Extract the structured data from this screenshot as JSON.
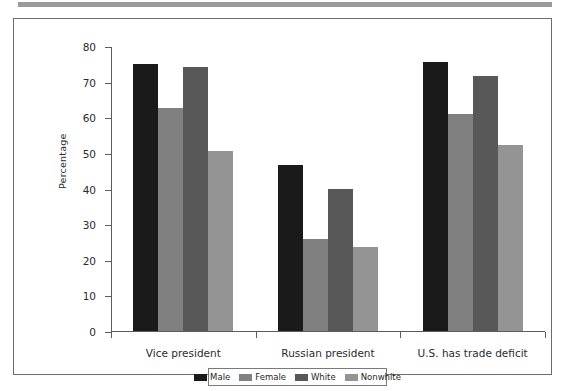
{
  "figure": {
    "top_rule_color": "#9a9a9a",
    "frame_border_color": "#6d6d6d"
  },
  "chart_data": {
    "type": "bar",
    "title": "",
    "subtitle": "",
    "xlabel": "",
    "ylabel": "Percentage",
    "ylim": [
      0,
      80
    ],
    "yticks": [
      0,
      10,
      20,
      30,
      40,
      50,
      60,
      70,
      80
    ],
    "ytick_labels": [
      "0",
      "10",
      "20",
      "30",
      "40",
      "50",
      "60",
      "70",
      "80"
    ],
    "grid": false,
    "legend_position": "bottom-center",
    "categories": [
      "Vice president",
      "Russian president",
      "U.S. has trade deficit"
    ],
    "series": [
      {
        "name": "Male",
        "color": "#1a1a1a",
        "values": [
          75.0,
          46.7,
          75.5
        ]
      },
      {
        "name": "Female",
        "color": "#808080",
        "values": [
          62.5,
          25.8,
          61.0
        ]
      },
      {
        "name": "White",
        "color": "#585858",
        "values": [
          74.0,
          39.8,
          71.5
        ]
      },
      {
        "name": "Nonwhite",
        "color": "#949494",
        "values": [
          50.5,
          23.5,
          52.3
        ]
      }
    ]
  },
  "legend": {
    "items": [
      {
        "label": "Male",
        "color": "#1a1a1a"
      },
      {
        "label": "Female",
        "color": "#808080"
      },
      {
        "label": "White",
        "color": "#585858"
      },
      {
        "label": "Nonwhite",
        "color": "#949494"
      }
    ]
  }
}
